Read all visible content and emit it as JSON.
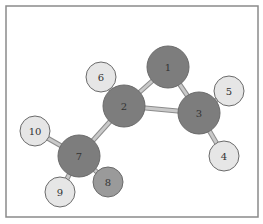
{
  "diagram": {
    "type": "ball-and-stick molecule",
    "frame": {
      "x": 6,
      "y": 6,
      "width": 252,
      "height": 211,
      "stroke": "#8a8a8a",
      "fill": "#ffffff"
    },
    "colors": {
      "heavy": "#7d7d7d",
      "medium": "#9a9a9a",
      "light": "#e6e6e6",
      "outline": "#6a6a6a",
      "bond": "#c9c9c9",
      "bond_outline": "#8c8c8c"
    },
    "atoms": [
      {
        "id": "1",
        "label": "1",
        "x": 168,
        "y": 67,
        "r": 21,
        "shade": "heavy"
      },
      {
        "id": "2",
        "label": "2",
        "x": 124,
        "y": 106,
        "r": 21,
        "shade": "heavy"
      },
      {
        "id": "3",
        "label": "3",
        "x": 199,
        "y": 113,
        "r": 21,
        "shade": "heavy"
      },
      {
        "id": "4",
        "label": "4",
        "x": 224,
        "y": 156,
        "r": 15,
        "shade": "light"
      },
      {
        "id": "5",
        "label": "5",
        "x": 229,
        "y": 91,
        "r": 15,
        "shade": "light"
      },
      {
        "id": "6",
        "label": "6",
        "x": 101,
        "y": 77,
        "r": 15,
        "shade": "light"
      },
      {
        "id": "7",
        "label": "7",
        "x": 79,
        "y": 156,
        "r": 21,
        "shade": "heavy"
      },
      {
        "id": "8",
        "label": "8",
        "x": 108,
        "y": 182,
        "r": 15,
        "shade": "medium"
      },
      {
        "id": "9",
        "label": "9",
        "x": 60,
        "y": 192,
        "r": 15,
        "shade": "light"
      },
      {
        "id": "10",
        "label": "10",
        "x": 35,
        "y": 131,
        "r": 15,
        "shade": "light"
      }
    ],
    "bonds": [
      [
        "1",
        "2"
      ],
      [
        "1",
        "3"
      ],
      [
        "2",
        "3"
      ],
      [
        "2",
        "6"
      ],
      [
        "2",
        "7"
      ],
      [
        "3",
        "4"
      ],
      [
        "3",
        "5"
      ],
      [
        "7",
        "8"
      ],
      [
        "7",
        "9"
      ],
      [
        "7",
        "10"
      ]
    ]
  }
}
